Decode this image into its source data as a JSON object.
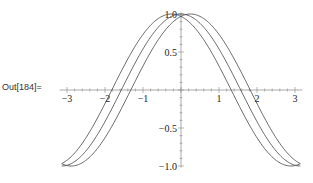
{
  "cell": {
    "out_label": "Out[184]="
  },
  "chart_data": {
    "type": "line",
    "title": "",
    "xlabel": "",
    "ylabel": "",
    "xlim": [
      -3.14,
      3.14
    ],
    "ylim": [
      -1.0,
      1.0
    ],
    "grid": false,
    "legend": null,
    "x_ticks": [
      "-3",
      "-2",
      "-1",
      "1",
      "2",
      "3"
    ],
    "y_ticks": [
      "1.0",
      "0.5",
      "-0.5",
      "-1.0"
    ],
    "series": [
      {
        "name": "cos(x - 0.25)",
        "function": "cos(x-0.25)",
        "x_range": [
          -3.14,
          3.14
        ]
      },
      {
        "name": "cos(x)",
        "function": "cos(x)",
        "x_range": [
          -3.14,
          3.14
        ]
      },
      {
        "name": "cos(x + 0.25)",
        "function": "cos(x+0.25)",
        "x_range": [
          -3.14,
          3.14
        ]
      }
    ],
    "sample_points": {
      "x": [
        -3,
        -2,
        -1,
        0,
        1,
        2,
        3
      ],
      "cos(x)": [
        -0.99,
        -0.42,
        0.54,
        1.0,
        0.54,
        -0.42,
        -0.99
      ]
    }
  }
}
